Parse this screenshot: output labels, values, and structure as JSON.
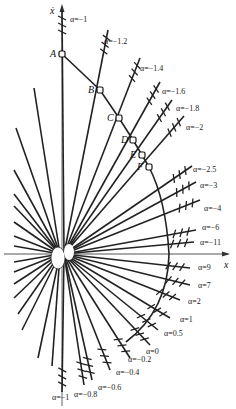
{
  "figure": {
    "type": "phase-plane isocline diagram",
    "origin_px": [
      62,
      254
    ],
    "axes": {
      "horizontal_label": "x",
      "vertical_label": "ẋ"
    },
    "trajectory_points": [
      {
        "name": "A",
        "px": [
          62,
          54
        ]
      },
      {
        "name": "B",
        "px": [
          100,
          90
        ]
      },
      {
        "name": "C",
        "px": [
          119,
          118
        ]
      },
      {
        "name": "D",
        "px": [
          133,
          140
        ]
      },
      {
        "name": "E",
        "px": [
          142,
          155
        ]
      },
      {
        "name": "F",
        "px": [
          149,
          167
        ]
      }
    ],
    "isoclines": [
      {
        "label": "α=−1",
        "end": [
          62,
          10
        ],
        "label_pos": [
          70,
          22
        ]
      },
      {
        "label": "α=−1.2",
        "end": [
          108,
          30
        ],
        "label_pos": [
          104,
          44
        ]
      },
      {
        "label": "α=−1.4",
        "end": [
          140,
          58
        ],
        "label_pos": [
          140,
          71
        ]
      },
      {
        "label": "α=−1.6",
        "end": [
          160,
          82
        ],
        "label_pos": [
          162,
          94
        ]
      },
      {
        "label": "α=−1.8",
        "end": [
          172,
          100
        ],
        "label_pos": [
          176,
          111
        ]
      },
      {
        "label": "α=−2",
        "end": [
          184,
          116
        ],
        "label_pos": [
          186,
          130
        ]
      },
      {
        "label": "α=−2.5",
        "end": [
          192,
          166
        ],
        "label_pos": [
          193,
          172
        ]
      },
      {
        "label": "α=−3",
        "end": [
          196,
          182
        ],
        "label_pos": [
          200,
          188
        ]
      },
      {
        "label": "α=−4",
        "end": [
          200,
          200
        ],
        "label_pos": [
          204,
          211
        ]
      },
      {
        "label": "α=−6",
        "end": [
          196,
          230
        ],
        "label_pos": [
          202,
          230
        ]
      },
      {
        "label": "α=−11",
        "end": [
          194,
          242
        ],
        "label_pos": [
          200,
          245
        ]
      },
      {
        "label": "α=9",
        "end": [
          190,
          268
        ],
        "label_pos": [
          198,
          270
        ]
      },
      {
        "label": "α=7",
        "end": [
          190,
          285
        ],
        "label_pos": [
          198,
          288
        ]
      },
      {
        "label": "α=2",
        "end": [
          180,
          300
        ],
        "label_pos": [
          188,
          304
        ]
      },
      {
        "label": "α=1",
        "end": [
          170,
          318
        ],
        "label_pos": [
          180,
          322
        ]
      },
      {
        "label": "α=0.5",
        "end": [
          158,
          330
        ],
        "label_pos": [
          164,
          336
        ]
      },
      {
        "label": "α=0",
        "end": [
          150,
          345
        ],
        "label_pos": [
          146,
          354
        ]
      },
      {
        "label": "α=−0.2",
        "end": [
          130,
          358
        ],
        "label_pos": [
          128,
          362
        ]
      },
      {
        "label": "α=−0.4",
        "end": [
          110,
          370
        ],
        "label_pos": [
          116,
          375
        ]
      },
      {
        "label": "α=−0.6",
        "end": [
          92,
          380
        ],
        "label_pos": [
          98,
          390
        ]
      },
      {
        "label": "α=−0.8",
        "end": [
          84,
          385
        ],
        "label_pos": [
          74,
          397
        ]
      },
      {
        "label": "α=−1",
        "end": [
          62,
          392
        ],
        "label_pos": [
          52,
          400
        ]
      }
    ]
  }
}
